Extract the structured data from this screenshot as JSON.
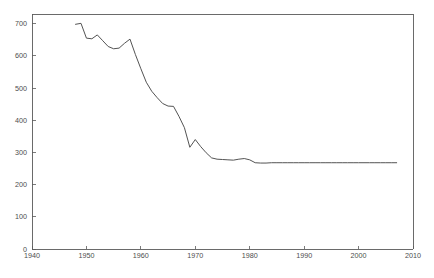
{
  "chart_data": {
    "type": "line",
    "title": "",
    "subtitle": "",
    "xlabel": "",
    "ylabel": "",
    "xlim": [
      1940,
      2010
    ],
    "ylim": [
      0,
      730
    ],
    "grid": false,
    "legend": false,
    "legend_position": "none",
    "xticks": [
      1940,
      1950,
      1960,
      1970,
      1980,
      1990,
      2000,
      2010
    ],
    "xtick_labels": [
      "1940",
      "1950",
      "1960",
      "1970",
      "1980",
      "1990",
      "2000",
      "2010"
    ],
    "yticks": [
      0,
      100,
      200,
      300,
      400,
      500,
      600,
      700
    ],
    "ytick_labels": [
      "0",
      "100",
      "200",
      "300",
      "400",
      "500",
      "600",
      "700"
    ],
    "series": [
      {
        "name": "series-1",
        "color": "#4a4a4a",
        "x": [
          1948,
          1949,
          1950,
          1951,
          1952,
          1953,
          1954,
          1955,
          1956,
          1957,
          1958,
          1959,
          1960,
          1961,
          1962,
          1963,
          1964,
          1965,
          1966,
          1967,
          1968,
          1969,
          1970,
          1971,
          1972,
          1973,
          1974,
          1975,
          1976,
          1977,
          1978,
          1979,
          1980,
          1981,
          1982,
          1983,
          1984,
          1985,
          1986,
          1987,
          1988,
          1989,
          1990,
          1991,
          1992,
          1993,
          1994,
          1995,
          1996,
          1997,
          1998,
          1999,
          2000,
          2001,
          2002,
          2003,
          2004,
          2005,
          2006,
          2007
        ],
        "values": [
          698,
          701,
          655,
          653,
          665,
          647,
          629,
          622,
          624,
          639,
          652,
          604,
          560,
          518,
          490,
          470,
          452,
          444,
          443,
          412,
          377,
          316,
          340,
          318,
          299,
          283,
          279,
          278,
          277,
          276,
          279,
          281,
          277,
          268,
          267,
          267,
          268,
          268,
          268,
          268,
          268,
          268,
          268,
          268,
          268,
          268,
          268,
          268,
          268,
          268,
          268,
          268,
          268,
          268,
          268,
          268,
          268,
          268,
          268,
          268
        ]
      }
    ]
  }
}
